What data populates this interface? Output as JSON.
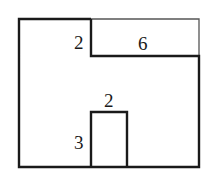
{
  "diagram": {
    "labels": {
      "notch_height": "2",
      "notch_width": "6",
      "inner_rect_width": "2",
      "inner_rect_height": "3"
    },
    "colors": {
      "stroke": "#1a1a1a",
      "thin_stroke": "#555555",
      "background": "#ffffff"
    }
  }
}
